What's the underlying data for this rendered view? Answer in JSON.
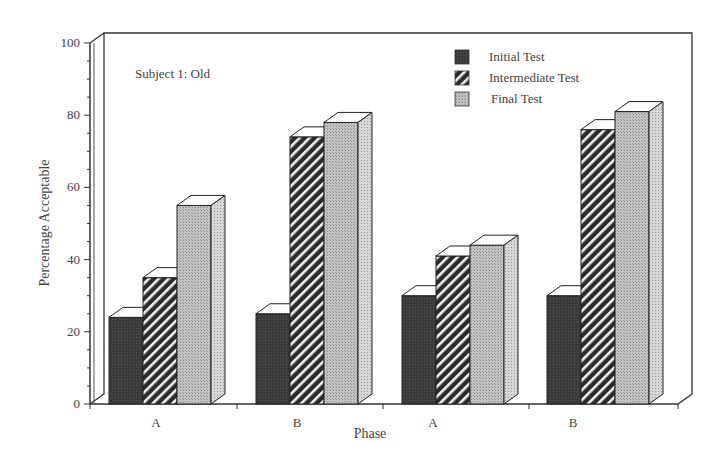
{
  "chart_data": {
    "type": "bar",
    "style": "3d-grouped",
    "title": "",
    "annotation": "Subject 1: Old",
    "xlabel": "Phase",
    "ylabel": "Percentage Acceptable",
    "ylim": [
      0,
      100
    ],
    "yticks": [
      0,
      20,
      40,
      60,
      80,
      100
    ],
    "grid": false,
    "legend_position": "top-right",
    "categories": [
      "A",
      "B",
      "A",
      "B"
    ],
    "series": [
      {
        "name": "Initial Test",
        "pattern": "solid-dark",
        "color": "#3a3a3a",
        "values": [
          24,
          25,
          30,
          30
        ]
      },
      {
        "name": "Intermediate Test",
        "pattern": "diagonal-hatch",
        "color": "#2e2e2e",
        "values": [
          35,
          74,
          41,
          76
        ]
      },
      {
        "name": "Final Test",
        "pattern": "stipple-light",
        "color": "#b8b8b8",
        "values": [
          55,
          78,
          44,
          81
        ]
      }
    ]
  }
}
